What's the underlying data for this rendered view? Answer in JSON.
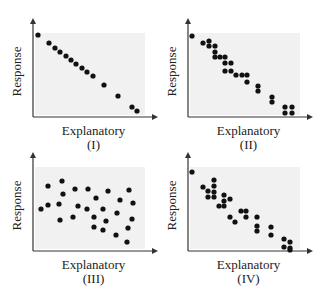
{
  "chart_data": [
    {
      "type": "scatter",
      "title": "",
      "caption": "(I)",
      "xlabel": "Explanatory",
      "ylabel": "Response",
      "grid": false,
      "description": "Strong negative linear relationship, points nearly on a straight line",
      "frame": {
        "x0": 33,
        "y0": 117,
        "x1": 158,
        "y1": 18
      },
      "shade": {
        "x": 35,
        "y": 33,
        "w": 110,
        "h": 82
      },
      "points_px": [
        [
          38,
          35
        ],
        [
          49,
          43
        ],
        [
          55,
          48
        ],
        [
          60,
          52
        ],
        [
          66,
          56
        ],
        [
          71,
          60
        ],
        [
          76,
          64
        ],
        [
          82,
          68
        ],
        [
          87,
          72
        ],
        [
          93,
          76
        ],
        [
          104,
          85
        ],
        [
          118,
          96
        ],
        [
          132,
          107
        ],
        [
          137,
          111
        ]
      ]
    },
    {
      "type": "scatter",
      "title": "",
      "caption": "(II)",
      "xlabel": "Explanatory",
      "ylabel": "Response",
      "grid": false,
      "description": "Strong negative relationship with repeated/stacked x values",
      "frame": {
        "x0": 188,
        "y0": 117,
        "x1": 313,
        "y1": 18
      },
      "shade": {
        "x": 190,
        "y": 33,
        "w": 110,
        "h": 82
      },
      "points_px": [
        [
          192,
          36
        ],
        [
          203,
          43
        ],
        [
          209,
          41
        ],
        [
          209,
          46
        ],
        [
          215,
          46
        ],
        [
          215,
          52
        ],
        [
          215,
          57
        ],
        [
          220,
          57
        ],
        [
          225,
          57
        ],
        [
          225,
          63
        ],
        [
          231,
          63
        ],
        [
          225,
          71
        ],
        [
          231,
          71
        ],
        [
          236,
          75
        ],
        [
          242,
          75
        ],
        [
          247,
          75
        ],
        [
          247,
          82
        ],
        [
          258,
          86
        ],
        [
          258,
          91
        ],
        [
          272,
          97
        ],
        [
          272,
          102
        ],
        [
          285,
          107
        ],
        [
          292,
          107
        ],
        [
          285,
          113
        ],
        [
          292,
          113
        ]
      ]
    },
    {
      "type": "scatter",
      "title": "",
      "caption": "(III)",
      "xlabel": "Explanatory",
      "ylabel": "Response",
      "grid": false,
      "description": "Weak/no apparent relationship, scattered cloud",
      "frame": {
        "x0": 33,
        "y0": 251,
        "x1": 158,
        "y1": 152
      },
      "shade": {
        "x": 35,
        "y": 167,
        "w": 110,
        "h": 82
      },
      "points_px": [
        [
          41,
          209
        ],
        [
          48,
          186
        ],
        [
          48,
          205
        ],
        [
          62,
          181
        ],
        [
          63,
          194
        ],
        [
          59,
          204
        ],
        [
          60,
          220
        ],
        [
          75,
          189
        ],
        [
          78,
          206
        ],
        [
          73,
          217
        ],
        [
          88,
          189
        ],
        [
          87,
          209
        ],
        [
          96,
          198
        ],
        [
          94,
          217
        ],
        [
          94,
          227
        ],
        [
          108,
          191
        ],
        [
          103,
          209
        ],
        [
          106,
          221
        ],
        [
          103,
          230
        ],
        [
          120,
          200
        ],
        [
          117,
          213
        ],
        [
          116,
          235
        ],
        [
          129,
          190
        ],
        [
          133,
          203
        ],
        [
          132,
          219
        ],
        [
          128,
          228
        ],
        [
          127,
          242
        ]
      ]
    },
    {
      "type": "scatter",
      "title": "",
      "caption": "(IV)",
      "xlabel": "Explanatory",
      "ylabel": "Response",
      "grid": false,
      "description": "Moderately strong negative relationship with more spread",
      "frame": {
        "x0": 188,
        "y0": 251,
        "x1": 313,
        "y1": 152
      },
      "shade": {
        "x": 190,
        "y": 167,
        "w": 110,
        "h": 82
      },
      "points_px": [
        [
          192,
          172
        ],
        [
          203,
          187
        ],
        [
          208,
          191
        ],
        [
          208,
          197
        ],
        [
          214,
          180
        ],
        [
          214,
          186
        ],
        [
          214,
          192
        ],
        [
          214,
          197
        ],
        [
          219,
          206
        ],
        [
          224,
          195
        ],
        [
          224,
          201
        ],
        [
          224,
          206
        ],
        [
          230,
          199
        ],
        [
          230,
          217
        ],
        [
          235,
          222
        ],
        [
          241,
          211
        ],
        [
          246,
          211
        ],
        [
          246,
          217
        ],
        [
          257,
          217
        ],
        [
          257,
          226
        ],
        [
          257,
          231
        ],
        [
          271,
          227
        ],
        [
          271,
          235
        ],
        [
          284,
          239
        ],
        [
          284,
          247
        ],
        [
          290,
          242
        ],
        [
          290,
          248
        ],
        [
          290,
          250
        ]
      ]
    }
  ],
  "colors": {
    "point": "#111111",
    "axis": "#333333",
    "shade": "#f1f1f1",
    "text": "#222222"
  }
}
